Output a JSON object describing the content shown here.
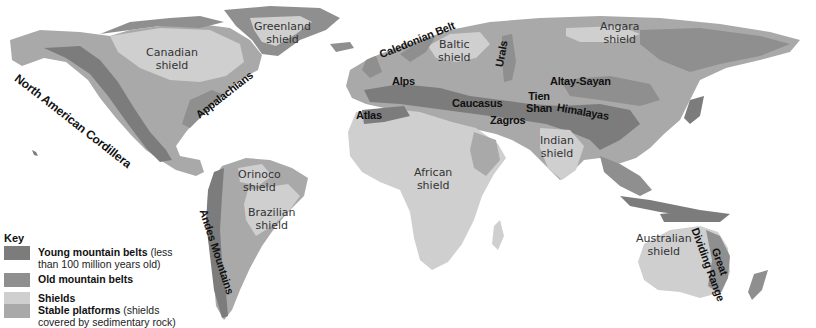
{
  "map": {
    "title": "World structural regions",
    "colors": {
      "ocean": "#ffffff",
      "young_mountain": "#7c7c7c",
      "old_mountain": "#8f8f8f",
      "shield": "#cfcfcf",
      "platform": "#a9a9a9"
    },
    "mountain_belts": [
      {
        "id": "north-american-cordillera",
        "label": "North American Cordillera"
      },
      {
        "id": "appalachians",
        "label": "Appalachians"
      },
      {
        "id": "caledonian-belt",
        "label": "Caledonian Belt"
      },
      {
        "id": "urals",
        "label": "Urals"
      },
      {
        "id": "alps",
        "label": "Alps"
      },
      {
        "id": "atlas",
        "label": "Atlas"
      },
      {
        "id": "caucasus",
        "label": "Caucasus"
      },
      {
        "id": "zagros",
        "label": "Zagros"
      },
      {
        "id": "tien-shan",
        "label": "Tien\nShan",
        "line1": "Tien",
        "line2": "Shan"
      },
      {
        "id": "altay-sayan",
        "label": "Altay-Sayan"
      },
      {
        "id": "himalayas",
        "label": "Himalayas"
      },
      {
        "id": "andes-mountains",
        "label": "Andes Mountains"
      },
      {
        "id": "great-dividing-range",
        "label": "Great Dividing Range",
        "line1": "Great",
        "line2": "Dividing Range"
      }
    ],
    "shields": [
      {
        "id": "canadian",
        "line1": "Canadian",
        "line2": "shield"
      },
      {
        "id": "greenland",
        "line1": "Greenland",
        "line2": "shield"
      },
      {
        "id": "baltic",
        "line1": "Baltic",
        "line2": "shield"
      },
      {
        "id": "angara",
        "line1": "Angara",
        "line2": "shield"
      },
      {
        "id": "indian",
        "line1": "Indian",
        "line2": "shield"
      },
      {
        "id": "orinoco",
        "line1": "Orinoco",
        "line2": "shield"
      },
      {
        "id": "brazilian",
        "line1": "Brazilian",
        "line2": "shield"
      },
      {
        "id": "african",
        "line1": "African",
        "line2": "shield"
      },
      {
        "id": "australian",
        "line1": "Australian",
        "line2": "shield"
      }
    ]
  },
  "key": {
    "title": "Key",
    "items": [
      {
        "bold": "Young mountain belts",
        "rest1": " (less",
        "rest2": "than 100 million years old)",
        "color": "#7c7c7c"
      },
      {
        "bold": "Old mountain belts",
        "rest1": "",
        "rest2": "",
        "color": "#8f8f8f"
      },
      {
        "bold": "Shields",
        "rest1": "",
        "rest2": "",
        "color": "#cfcfcf"
      },
      {
        "bold": "Stable platforms",
        "rest1": " (shields",
        "rest2": "covered by sedimentary rock)",
        "color": "#a9a9a9"
      }
    ]
  }
}
